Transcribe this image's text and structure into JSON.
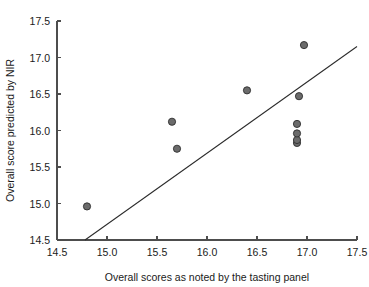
{
  "chart_data": {
    "type": "scatter",
    "title": "",
    "xlabel": "Overall scores as noted by the tasting panel",
    "ylabel": "Overall score predicted by NIR",
    "xlim": [
      14.5,
      17.5
    ],
    "ylim": [
      14.5,
      17.5
    ],
    "xticks": [
      "14.5",
      "15.0",
      "15.5",
      "16.0",
      "16.5",
      "17.0",
      "17.5"
    ],
    "yticks": [
      "14.5",
      "15.0",
      "15.5",
      "16.0",
      "16.5",
      "17.0",
      "17.5"
    ],
    "xtick_values": [
      14.5,
      15.0,
      15.5,
      16.0,
      16.5,
      17.0,
      17.5
    ],
    "ytick_values": [
      14.5,
      15.0,
      15.5,
      16.0,
      16.5,
      17.0,
      17.5
    ],
    "grid": false,
    "legend": false,
    "marker_style": "filled-circle-dark-gray",
    "series": [
      {
        "name": "samples",
        "x": [
          14.8,
          15.65,
          15.7,
          16.4,
          16.9,
          16.9,
          16.9,
          16.9,
          16.92,
          16.97
        ],
        "y": [
          14.96,
          16.12,
          15.75,
          16.55,
          15.83,
          15.87,
          15.96,
          16.09,
          16.47,
          17.17
        ]
      }
    ],
    "fit_line": {
      "name": "regression line",
      "x": [
        14.78,
        17.5
      ],
      "y": [
        14.5,
        17.15
      ]
    },
    "colors": {
      "marker_fill": "#6b6b6b",
      "marker_edge": "#2e2e2e",
      "line": "#2b2b2b",
      "axis": "#4d4d4d",
      "text": "#1a1a1a",
      "background": "#ffffff"
    },
    "geometry": {
      "plot_left": 57,
      "plot_right": 357,
      "plot_bottom": 240,
      "plot_top": 21,
      "marker_radius": 3.6,
      "tick_length": 4
    }
  }
}
